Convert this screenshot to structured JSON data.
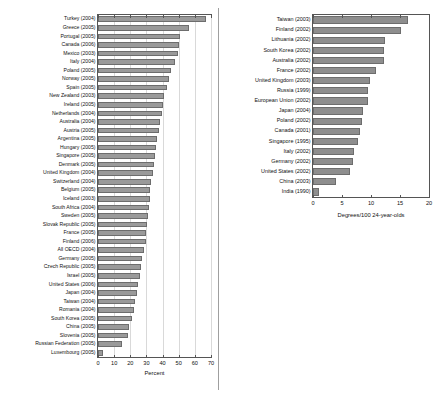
{
  "figure": {
    "caption": ""
  },
  "chart_data": [
    {
      "type": "bar",
      "orientation": "horizontal",
      "panel": "left",
      "title": "",
      "xlabel": "Percent",
      "ylabel": "",
      "xlim": [
        0,
        70
      ],
      "xticks": [
        0,
        10,
        20,
        30,
        40,
        50,
        60,
        70
      ],
      "xticklabels": [
        "0",
        "10",
        "20",
        "30",
        "40",
        "50",
        "60",
        "70"
      ],
      "grid": true,
      "legend": "none",
      "bar_color": "#9a9a9a",
      "categories": [
        "Turkey (2004)",
        "Greece (2005)",
        "Portugal (2005)",
        "Canada (2006)",
        "Mexico (2003)",
        "Italy (2004)",
        "Poland (2005)",
        "Norway (2005)",
        "Spain (2005)",
        "New Zealand (2003)",
        "Ireland (2005)",
        "Netherlands (2004)",
        "Australia (2004)",
        "Austria (2005)",
        "Argentina (2005)",
        "Hungary (2005)",
        "Singapore (2005)",
        "Denmark (2005)",
        "United Kingdom (2004)",
        "Switzerland (2004)",
        "Belgium (2005)",
        "Iceland (2003)",
        "South Africa (2004)",
        "Sweden (2005)",
        "Slovak Republic (2005)",
        "France (2005)",
        "Finland (2006)",
        "All OECD (2004)",
        "Germany (2005)",
        "Czech Republic (2005)",
        "Israel (2005)",
        "United States (2006)",
        "Japan (2004)",
        "Taiwan (2004)",
        "Romania (2004)",
        "South Korea (2005)",
        "China (2005)",
        "Slovenia (2005)",
        "Russian Federation (2005)",
        "Luxembourg (2005)"
      ],
      "values": [
        67.0,
        56.5,
        50.5,
        50.3,
        49.8,
        47.5,
        45.3,
        44.0,
        42.5,
        41.0,
        40.0,
        39.5,
        38.5,
        37.5,
        36.5,
        35.8,
        35.0,
        34.5,
        33.8,
        33.0,
        32.5,
        32.0,
        31.5,
        31.0,
        30.5,
        30.0,
        29.5,
        28.5,
        27.5,
        26.5,
        26.0,
        25.0,
        24.0,
        23.0,
        22.0,
        21.0,
        19.5,
        18.5,
        15.0,
        3.0
      ]
    },
    {
      "type": "bar",
      "orientation": "horizontal",
      "panel": "right",
      "title": "",
      "xlabel": "Degrees/100 24-year-olds",
      "ylabel": "",
      "xlim": [
        0,
        20
      ],
      "xticks": [
        0,
        5,
        10,
        15,
        20
      ],
      "xticklabels": [
        "0",
        "5",
        "10",
        "15",
        "20"
      ],
      "grid": false,
      "legend": "none",
      "bar_color": "#8e8e8e",
      "categories": [
        "Taiwan (2003)",
        "Finland (2002)",
        "Lithuania (2002)",
        "South Korea (2002)",
        "Australia (2002)",
        "France (2002)",
        "United Kingdom (2003)",
        "Russia (1999)",
        "European Union (2002)",
        "Japan (2004)",
        "Poland (2002)",
        "Canada (2001)",
        "Singapore (1995)",
        "Italy (2002)",
        "Germany (2002)",
        "United States (2002)",
        "China (2003)",
        "India (1990)"
      ],
      "values": [
        16.3,
        15.1,
        12.4,
        12.3,
        12.3,
        10.9,
        9.8,
        9.5,
        9.4,
        8.6,
        8.4,
        8.1,
        7.8,
        7.1,
        6.9,
        6.4,
        4.0,
        1.1
      ]
    }
  ]
}
